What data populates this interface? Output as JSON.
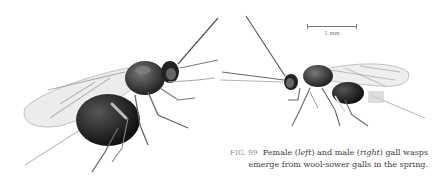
{
  "figure": {
    "number": "FIG. 99",
    "caption_parts": {
      "a": "Female (",
      "b": "left",
      "c": ") and male (",
      "d": "right",
      "e": ") gall wasps",
      "line2": "emerge from wool-sower galls in the spring."
    },
    "subjects": [
      {
        "name": "Female gall wasp",
        "position": "left"
      },
      {
        "name": "Male gall wasp",
        "position": "right"
      }
    ],
    "scale_bar": {
      "label": "1 mm"
    }
  }
}
